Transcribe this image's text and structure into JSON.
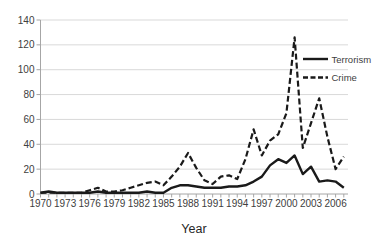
{
  "chart_data": {
    "type": "line",
    "title": "",
    "xlabel": "Year",
    "ylabel": "",
    "ylim": [
      0,
      140
    ],
    "ytick_step": 20,
    "grid": "horizontal",
    "legend_position": "right-inside",
    "xtick_labels": [
      "1970",
      "1973",
      "1976",
      "1979",
      "1982",
      "1985",
      "1988",
      "1991",
      "1994",
      "1997",
      "2000",
      "2003",
      "2006"
    ],
    "x": [
      1970,
      1971,
      1972,
      1973,
      1974,
      1975,
      1976,
      1977,
      1978,
      1979,
      1980,
      1981,
      1982,
      1983,
      1984,
      1985,
      1986,
      1987,
      1988,
      1989,
      1990,
      1991,
      1992,
      1993,
      1994,
      1995,
      1996,
      1997,
      1998,
      1999,
      2000,
      2001,
      2002,
      2003,
      2004,
      2005,
      2006,
      2007
    ],
    "series": [
      {
        "name": "Terrorism",
        "line_style": "solid",
        "values": [
          1,
          2,
          1,
          1,
          1,
          1,
          1,
          2,
          1,
          1,
          1,
          1,
          1,
          2,
          1,
          1,
          5,
          7,
          7,
          6,
          5,
          5,
          5,
          6,
          6,
          7,
          10,
          14,
          23,
          28,
          25,
          31,
          16,
          22,
          10,
          11,
          10,
          5
        ]
      },
      {
        "name": "Crime",
        "line_style": "dashed",
        "values": [
          1,
          1,
          1,
          1,
          1,
          1,
          3,
          5,
          2,
          2,
          3,
          5,
          7,
          9,
          10,
          7,
          14,
          22,
          33,
          21,
          11,
          8,
          14,
          15,
          12,
          28,
          52,
          31,
          43,
          48,
          65,
          126,
          37,
          57,
          77,
          46,
          20,
          30
        ]
      }
    ],
    "colors": {
      "series": "#1a1a1a",
      "grid": "#d9d9d9",
      "axis": "#a6a6a6",
      "text": "#404040"
    }
  }
}
